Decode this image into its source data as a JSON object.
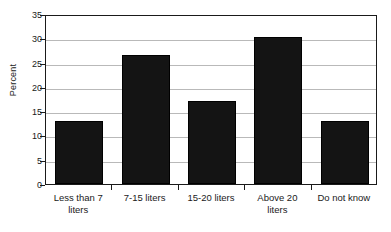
{
  "chart_data": {
    "type": "bar",
    "title": "",
    "xlabel": "",
    "ylabel": "Percent",
    "categories": [
      "Less than 7 liters",
      "7-15 liters",
      "15-20 liters",
      "Above 20 liters",
      "Do not know"
    ],
    "category_lines": [
      [
        "Less than 7",
        "liters"
      ],
      [
        "7-15 liters"
      ],
      [
        "15-20 liters"
      ],
      [
        "Above 20",
        "liters"
      ],
      [
        "Do not know"
      ]
    ],
    "values": [
      13,
      26.5,
      17,
      30.2,
      13
    ],
    "ylim": [
      0,
      35
    ],
    "ytick_step": 5,
    "yticks": [
      0,
      5,
      10,
      15,
      20,
      25,
      30,
      35
    ],
    "ytick_labels": [
      "0",
      "5",
      "10",
      "15",
      "20",
      "25",
      "30",
      "35"
    ],
    "grid": true,
    "grid_axis": "y",
    "legend": false,
    "bar_color": "#141414",
    "grid_color": "#b9b9b9",
    "axis_color": "#1a1a1a",
    "background_color": "#ffffff"
  }
}
